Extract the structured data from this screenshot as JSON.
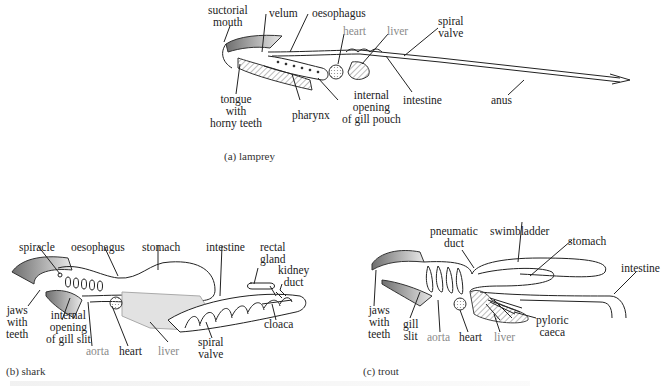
{
  "panels": {
    "lamprey": {
      "caption": "(a) lamprey",
      "labels": {
        "suctorial_mouth": "suctorial\nmouth",
        "velum": "velum",
        "oesophagus": "oesophagus",
        "heart": "heart",
        "liver": "liver",
        "spiral_valve": "spiral\nvalve",
        "tongue": "tongue\nwith\nhorny teeth",
        "pharynx": "pharynx",
        "internal_opening": "internal\nopening\nof gill pouch",
        "intestine": "intestine",
        "anus": "anus"
      }
    },
    "shark": {
      "caption": "(b) shark",
      "labels": {
        "spiracle": "spiracle",
        "oesophagus": "oesophagus",
        "stomach": "stomach",
        "intestine": "intestine",
        "rectal_gland": "rectal\ngland",
        "kidney_duct": "kidney\nduct",
        "jaws": "jaws\nwith\nteeth",
        "internal_opening": "internal\nopening\nof gill slit",
        "aorta": "aorta",
        "heart": "heart",
        "liver": "liver",
        "spiral_valve": "spiral\nvalve",
        "cloaca": "cloaca"
      }
    },
    "trout": {
      "caption": "(c) trout",
      "labels": {
        "pneumatic_duct": "pneumatic\nduct",
        "swimbladder": "swimbladder",
        "stomach": "stomach",
        "intestine": "intestine",
        "jaws": "jaws\nwith\nteeth",
        "gill_slit": "gill\nslit",
        "aorta": "aorta",
        "heart": "heart",
        "liver": "liver",
        "pyloric_caeca": "pyloric\ncaeca"
      }
    }
  },
  "colors": {
    "line": "#222222",
    "label_dark": "#222222",
    "label_grey": "#8a8a8a",
    "shade": "#9a9a9a",
    "liver_fill": "#d8d8d8"
  }
}
